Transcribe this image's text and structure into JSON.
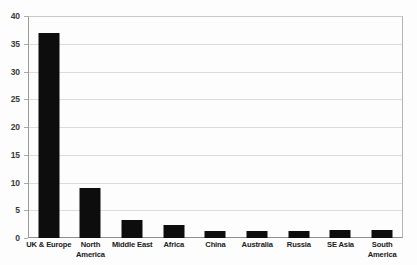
{
  "chart_data": {
    "type": "bar",
    "title": "",
    "subtitle": "",
    "xlabel": "",
    "ylabel": "",
    "categories": [
      "UK & Europe",
      "North America",
      "Middle East",
      "Africa",
      "China",
      "Australia",
      "Russia",
      "SE Asia",
      "South America"
    ],
    "values": [
      37,
      9,
      3.3,
      2.3,
      1.2,
      1.3,
      1.3,
      1.4,
      1.5
    ],
    "ylim": [
      0,
      40
    ],
    "ytick_labels": [
      "0",
      "5",
      "10",
      "15",
      "20",
      "25",
      "30",
      "35",
      "40"
    ],
    "ytick_values": [
      0,
      5,
      10,
      15,
      20,
      25,
      30,
      35,
      40
    ],
    "grid": true,
    "legend": false,
    "legend_position": "none",
    "bar_color": "#0d0d0d",
    "gridline_color": "#dcdcdc",
    "axis_color": "#8f8f8f",
    "background_color": "#ffffff"
  }
}
